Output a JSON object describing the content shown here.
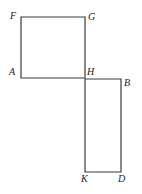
{
  "figure": {
    "type": "geometry-diagram",
    "background_color": "#ffffff",
    "stroke_color": "#3a3a3a",
    "stroke_width": 1.2,
    "label_color": "#1a1a1a",
    "shapes": [
      {
        "name": "upper-square-FGHA",
        "vertices": [
          "F",
          "G",
          "H",
          "A"
        ],
        "points": [
          [
            21,
            17
          ],
          [
            85,
            17
          ],
          [
            85,
            78
          ],
          [
            21,
            78
          ]
        ]
      },
      {
        "name": "lower-rectangle-HBDK",
        "vertices": [
          "H",
          "B",
          "D",
          "K"
        ],
        "points": [
          [
            85,
            79
          ],
          [
            121,
            79
          ],
          [
            121,
            172
          ],
          [
            85,
            172
          ]
        ]
      }
    ],
    "labels": [
      {
        "name": "vertex-label-F",
        "text": "F",
        "x": 10,
        "y": 11
      },
      {
        "name": "vertex-label-G",
        "text": "G",
        "x": 88,
        "y": 12
      },
      {
        "name": "vertex-label-A",
        "text": "A",
        "x": 9,
        "y": 67
      },
      {
        "name": "vertex-label-H",
        "text": "H",
        "x": 87,
        "y": 67
      },
      {
        "name": "vertex-label-B",
        "text": "B",
        "x": 124,
        "y": 78
      },
      {
        "name": "vertex-label-K",
        "text": "K",
        "x": 81,
        "y": 174
      },
      {
        "name": "vertex-label-D",
        "text": "D",
        "x": 118,
        "y": 174
      }
    ]
  }
}
